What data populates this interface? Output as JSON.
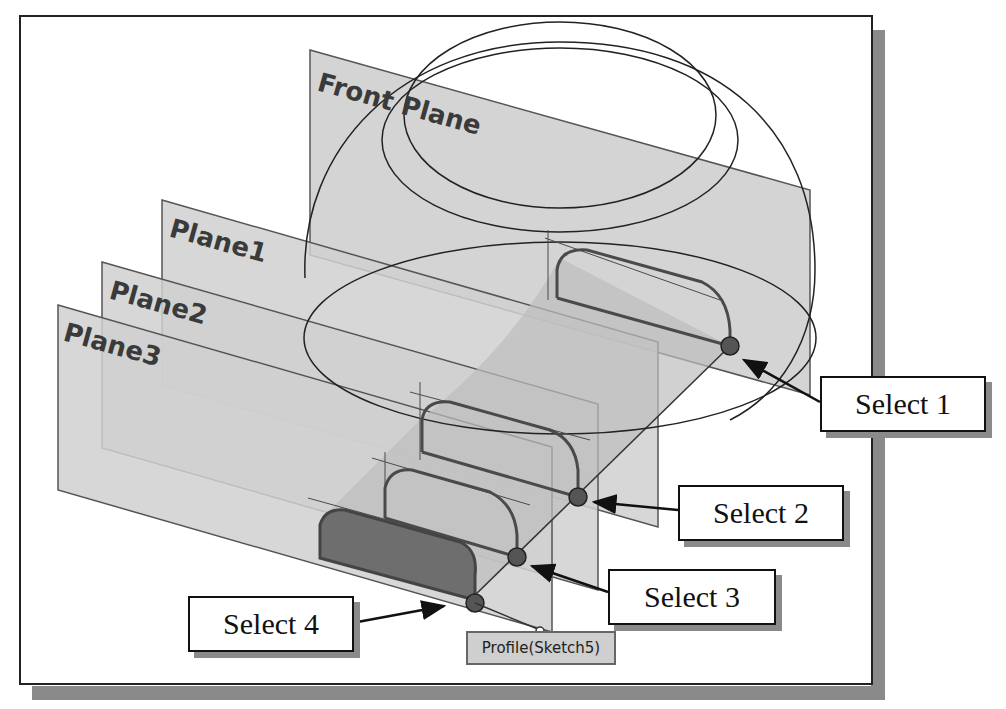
{
  "planes": [
    {
      "name": "Front Plane"
    },
    {
      "name": "Plane1"
    },
    {
      "name": "Plane2"
    },
    {
      "name": "Plane3"
    }
  ],
  "callouts": [
    {
      "label": "Select 1"
    },
    {
      "label": "Select 2"
    },
    {
      "label": "Select 3"
    },
    {
      "label": "Select 4"
    }
  ],
  "profile_tag": {
    "label": "Profile(Sketch5)"
  },
  "colors": {
    "plane_fill": "#d4d4d4",
    "plane_edge": "#555555",
    "sketch": "#4a4a4a",
    "selected_profile": "#6e6e6e",
    "frame_shadow": "#8a8a8a"
  }
}
